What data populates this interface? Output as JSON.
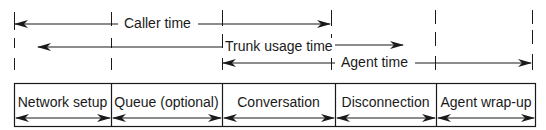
{
  "diagram": {
    "colors": {
      "ink": "#1a1a1a",
      "background": "#ffffff"
    },
    "timelines": [
      {
        "id": "caller-time",
        "label": "Caller time",
        "direction": "bidirectional",
        "spans": [
          "Network setup",
          "Queue (optional)",
          "Conversation"
        ]
      },
      {
        "id": "trunk-usage-time",
        "label": "Trunk usage time",
        "direction": "bidirectional",
        "spans": [
          "Queue (optional)",
          "Conversation",
          "Disconnection"
        ]
      },
      {
        "id": "agent-time",
        "label": "Agent time",
        "direction": "bidirectional",
        "spans": [
          "Conversation",
          "Disconnection",
          "Agent wrap-up"
        ]
      }
    ],
    "segments": [
      {
        "label": "Network setup"
      },
      {
        "label": "Queue (optional)"
      },
      {
        "label": "Conversation"
      },
      {
        "label": "Disconnection"
      },
      {
        "label": "Agent wrap-up"
      }
    ]
  }
}
